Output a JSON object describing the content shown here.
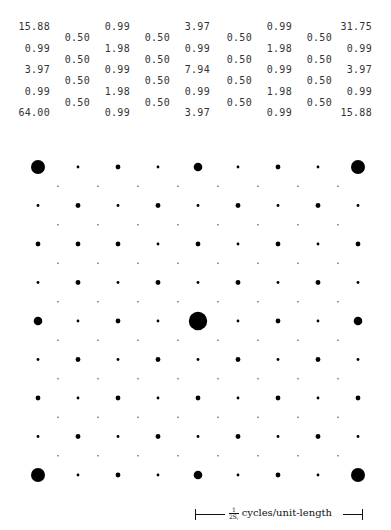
{
  "table": {
    "primary_rows": [
      [
        "15.88",
        "0.99",
        "3.97",
        "0.99",
        "31.75"
      ],
      [
        "0.99",
        "1.98",
        "0.99",
        "1.98",
        "0.99"
      ],
      [
        "3.97",
        "0.99",
        "7.94",
        "0.99",
        "3.97"
      ],
      [
        "0.99",
        "1.98",
        "0.99",
        "1.98",
        "0.99"
      ],
      [
        "64.00",
        "0.99",
        "3.97",
        "0.99",
        "15.88"
      ]
    ],
    "offset_rows": [
      [
        "0.50",
        "0.50",
        "0.50",
        "0.50"
      ],
      [
        "0.50",
        "0.50",
        "0.50",
        "0.50"
      ],
      [
        "0.50",
        "0.50",
        "0.50",
        "0.50"
      ],
      [
        "0.50",
        "0.50",
        "0.50",
        "0.50"
      ]
    ]
  },
  "lattice": {
    "description": "Reciprocal-lattice spot pattern; spot area proportional to intensity",
    "main_grid_size": 9,
    "offset_grid_size": 8,
    "main_grid_intensity_classes": [
      [
        "xl",
        "s",
        "m",
        "s",
        "l",
        "s",
        "m",
        "s",
        "xl"
      ],
      [
        "s",
        "m",
        "s",
        "m",
        "s",
        "m",
        "s",
        "m",
        "s"
      ],
      [
        "m",
        "m",
        "m",
        "s",
        "m",
        "s",
        "m",
        "s",
        "m"
      ],
      [
        "s",
        "m",
        "s",
        "m",
        "s",
        "m",
        "s",
        "m",
        "s"
      ],
      [
        "l",
        "s",
        "m",
        "s",
        "xxl",
        "s",
        "m",
        "s",
        "l"
      ],
      [
        "s",
        "m",
        "s",
        "m",
        "s",
        "m",
        "s",
        "m",
        "s"
      ],
      [
        "m",
        "s",
        "m",
        "s",
        "m",
        "s",
        "m",
        "s",
        "m"
      ],
      [
        "s",
        "m",
        "s",
        "m",
        "s",
        "m",
        "s",
        "m",
        "s"
      ],
      [
        "xl",
        "s",
        "m",
        "s",
        "l",
        "s",
        "m",
        "s",
        "xl"
      ]
    ],
    "offset_intensity_class": "xs"
  },
  "scale_bar": {
    "fraction_numerator": "1",
    "fraction_denominator": "2S,",
    "unit_label": "cycles/unit-length"
  }
}
